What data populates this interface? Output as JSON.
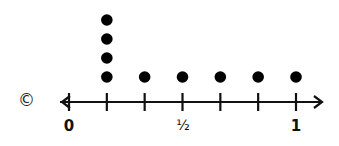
{
  "copyright_symbol": "©",
  "chart_data": {
    "type": "scatter",
    "subtype": "dot_plot",
    "title": "",
    "xlabel": "",
    "ylabel": "",
    "xlim": [
      0,
      1
    ],
    "tick_positions": [
      0,
      0.1667,
      0.3333,
      0.5,
      0.6667,
      0.8333,
      1
    ],
    "tick_labels": [
      "0",
      "",
      "",
      "½",
      "",
      "",
      "1"
    ],
    "categories": [
      "1/6",
      "2/6",
      "3/6",
      "4/6",
      "5/6",
      "6/6"
    ],
    "values": [
      4,
      1,
      1,
      1,
      1,
      1
    ],
    "grid": false,
    "legend": null,
    "axis_arrows": [
      "left",
      "right"
    ],
    "dot_color": "#000000"
  },
  "labels": {
    "zero": "0",
    "half": "½",
    "one": "1"
  }
}
